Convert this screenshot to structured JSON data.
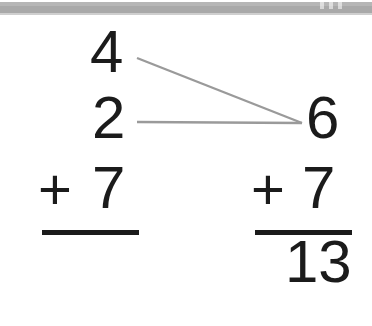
{
  "header": {
    "band_label": "scanned-page-edge",
    "band_color": "#a9a9a9",
    "notch_count": 3
  },
  "worksheet": {
    "title": "",
    "ink_color": "#1b1b1b",
    "connector_color": "#9a9a9a",
    "left_problem": {
      "name": "original-addition-problem",
      "addend_top": "4",
      "addend_middle": "2",
      "operator": "+",
      "addend_bottom": "7",
      "sum": ""
    },
    "right_problem": {
      "name": "regrouped-addition-problem",
      "partial_sum": "6",
      "operator": "+",
      "addend": "7",
      "sum": "13"
    },
    "connectors": [
      {
        "name": "connector-from-4-to-6",
        "from": "4",
        "to": "6",
        "x1": 137,
        "y1": 58,
        "x2": 302,
        "y2": 123
      },
      {
        "name": "connector-from-2-to-6",
        "from": "2",
        "to": "6",
        "x1": 137,
        "y1": 122,
        "x2": 302,
        "y2": 123
      }
    ]
  }
}
